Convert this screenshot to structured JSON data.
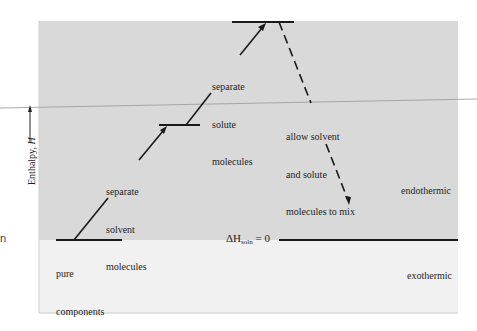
{
  "diagram": {
    "title": "",
    "axis_label": "Enthalpy, H",
    "axis_label_prefix": "Enthalpy, ",
    "axis_label_symbol": "H",
    "regions": [
      {
        "name": "endothermic",
        "label": "endothermic",
        "color": "#d9d9d9"
      },
      {
        "name": "exothermic",
        "label": "exothermic",
        "color": "#f1f1f1"
      }
    ],
    "levels": [
      {
        "name": "pure-components",
        "label_line1": "pure",
        "label_line2": "components"
      },
      {
        "name": "separated-solvent",
        "label_line1": "separate",
        "label_line2": "solvent",
        "label_line3": "molecules"
      },
      {
        "name": "separated-solute",
        "label_line1": "separate",
        "label_line2": "solute",
        "label_line3": "molecules"
      }
    ],
    "mix_step": {
      "label_line1": "allow solvent",
      "label_line2": "and solute",
      "label_line3": "molecules to mix"
    },
    "reference_line": {
      "symbol": "ΔH",
      "subscript": "soln",
      "suffix": " = 0"
    },
    "edge_fragment": "n"
  }
}
